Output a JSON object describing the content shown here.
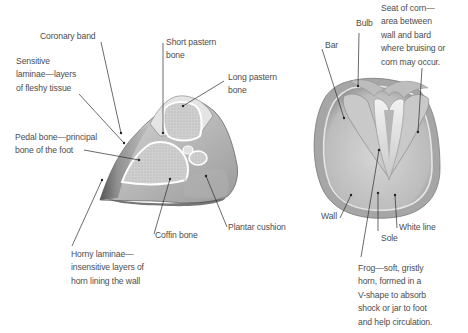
{
  "diagram": {
    "panels": [
      {
        "name": "cross-section",
        "view": "side cutaway of hoof",
        "labels": [
          {
            "id": "coronary_band",
            "text": "Coronary band"
          },
          {
            "id": "short_pastern",
            "text": "Short pastern\nbone"
          },
          {
            "id": "sensitive_laminae",
            "text": "Sensitive\nlaminae—layers\nof fleshy tissue"
          },
          {
            "id": "long_pastern",
            "text": "Long pastern\nbone"
          },
          {
            "id": "pedal_bone",
            "text": "Pedal bone—principal\nbone of the foot"
          },
          {
            "id": "plantar_cushion",
            "text": "Plantar cushion"
          },
          {
            "id": "coffin_bone",
            "text": "Coffin bone"
          },
          {
            "id": "horny_laminae",
            "text": "Horny laminae—\ninsensitive layers of\nhorn lining the wall"
          }
        ]
      },
      {
        "name": "underside",
        "view": "sole of hoof from below",
        "labels": [
          {
            "id": "seat_of_corn",
            "text": "Seat of corn—\narea between\nwall and bard\nwhere bruising or\ncorn may occur."
          },
          {
            "id": "bulb",
            "text": "Bulb"
          },
          {
            "id": "bar",
            "text": "Bar"
          },
          {
            "id": "wall",
            "text": "Wall"
          },
          {
            "id": "white_line",
            "text": "White line"
          },
          {
            "id": "sole",
            "text": "Sole"
          },
          {
            "id": "frog",
            "text": "Frog—soft, gristly\nhorn, formed in a\nV-shape to absorb\nshock or jar to foot\nand help circulation."
          }
        ]
      }
    ],
    "colors": {
      "background": "#ffffff",
      "label_text": "#4d4d4d",
      "leader_line": "#2b2b2b",
      "tissue_light": "#e9e9e9",
      "tissue_mid": "#c4c4c4",
      "tissue_dark": "#6e6e6e"
    }
  }
}
